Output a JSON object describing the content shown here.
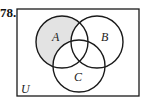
{
  "problem": {
    "number": "78."
  },
  "venn": {
    "universe_label": "U",
    "sets": [
      {
        "label": "A",
        "cx": 62,
        "cy": 42,
        "r": 26
      },
      {
        "label": "B",
        "cx": 97,
        "cy": 42,
        "r": 26
      },
      {
        "label": "C",
        "cx": 79,
        "cy": 66,
        "r": 26
      }
    ],
    "shaded_region": "A only (A minus B and C)",
    "shade_color": "#e3e3e3",
    "line_color": "#1a1a1a"
  }
}
